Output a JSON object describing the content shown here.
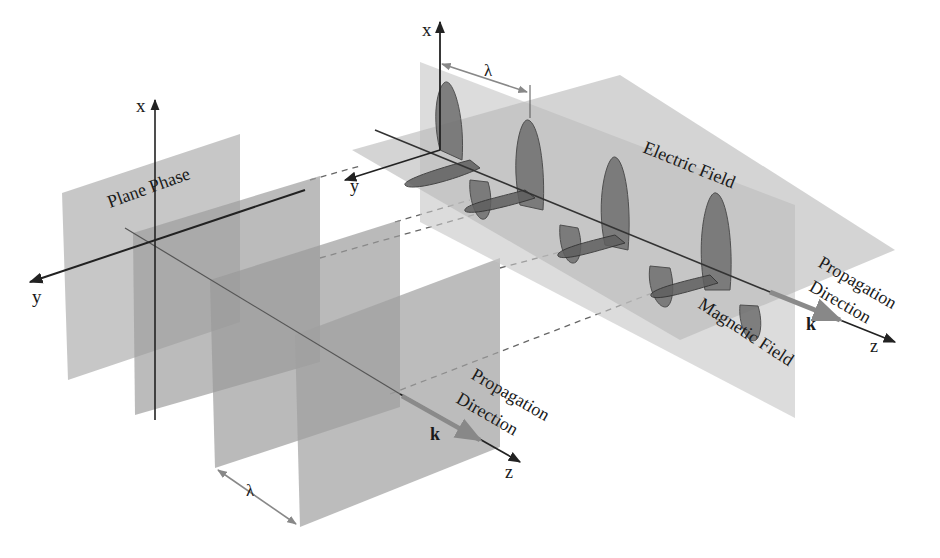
{
  "figure": {
    "left": {
      "axis_x_label": "x",
      "axis_y_label": "y",
      "axis_z_label": "z",
      "plane_label": "Plane Phase",
      "k_label": "k",
      "propagation_line1": "Propagation",
      "propagation_line2": "Direction",
      "wavelength_label": "λ"
    },
    "right": {
      "axis_x_label": "x",
      "axis_y_label": "y",
      "axis_z_label": "z",
      "electric_label": "Electric Field",
      "magnetic_label": "Magnetic Field",
      "k_label": "k",
      "propagation_line1": "Propagation",
      "propagation_line2": "Direction",
      "wavelength_label": "λ"
    },
    "colors": {
      "plane_fill": "#9a9a9a",
      "plane_light": "#c8c8c8",
      "lobe_fill": "#6e6e6e",
      "axis": "#222222",
      "arrow_gray": "#8a8a8a"
    }
  }
}
